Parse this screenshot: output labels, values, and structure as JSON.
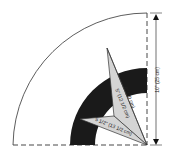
{
  "diagram": {
    "type": "quilt-template-quarter-circle",
    "dimensions": {
      "height_label": "10\" (25 cm)",
      "long_point_label": "8\" (20 cm)",
      "mid_label": "5\" (12 1/2 cm)",
      "short_point_label": "5 1/2\" (13 1/2 cm)"
    },
    "colors": {
      "outline": "#333333",
      "band": "#1a1a1a",
      "star_fill": "#d4d4d4",
      "background": "#ffffff"
    }
  }
}
